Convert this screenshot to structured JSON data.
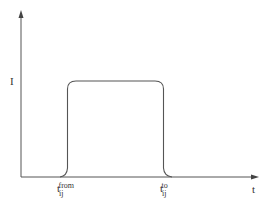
{
  "diagram": {
    "y_axis_label": "I",
    "x_axis_label": "t",
    "markers": [
      {
        "base": "t",
        "sub": "ij",
        "sup": "from"
      },
      {
        "base": "t",
        "sub": "ij",
        "sup": "to"
      }
    ],
    "shape": "rectangular pulse with rounded corners",
    "line_color": "#555555"
  }
}
